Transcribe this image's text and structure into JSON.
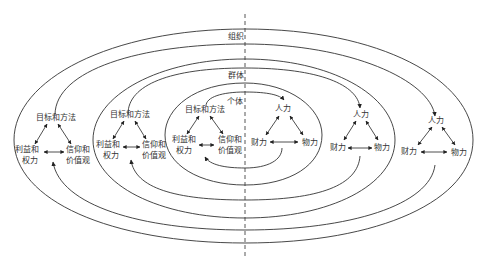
{
  "diagram": {
    "axis_style": "dashed-vertical",
    "levels": [
      {
        "label": "组织",
        "name": "organization"
      },
      {
        "label": "群体",
        "name": "group"
      },
      {
        "label": "个体",
        "name": "individual"
      }
    ],
    "left_triangles": [
      {
        "top": "目标和方法",
        "left_l1": "利益和",
        "left_l2": "权力",
        "right_l1": "信仰和",
        "right_l2": "价值观"
      },
      {
        "top": "目标和方法",
        "left_l1": "利益和",
        "left_l2": "权力",
        "right_l1": "信仰和",
        "right_l2": "价值观"
      },
      {
        "top": "目标和方法",
        "left_l1": "利益和",
        "left_l2": "权力",
        "right_l1": "信仰和",
        "right_l2": "价值观"
      }
    ],
    "right_triangles": [
      {
        "top": "人力",
        "left": "财力",
        "right": "物力"
      },
      {
        "top": "人力",
        "left": "财力",
        "right": "物力"
      },
      {
        "top": "人力",
        "left": "财力",
        "right": "物力"
      }
    ],
    "colors": {
      "line": "#333333",
      "text": "#333333",
      "background": "#ffffff"
    }
  }
}
